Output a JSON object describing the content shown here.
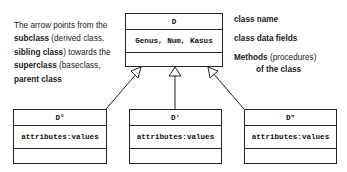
{
  "explanation": {
    "line1": "The arrow points from the",
    "subclass": "subclass",
    "line2_rest": " (derived class,",
    "sibling": "sibling class",
    "line3_rest": ") towards the",
    "superclass": "superclass",
    "line4_rest": " (baseclass,",
    "parent": "parent class"
  },
  "superclass_box": {
    "name": "D",
    "fields": "Genus, Num, Kasus",
    "methods": ""
  },
  "legend": {
    "class_name": "class name",
    "class_data_fields": "class data fields",
    "methods_bold": "Methods",
    "methods_rest": " (procedures)",
    "methods_line2": "of the class"
  },
  "subclasses": [
    {
      "name": "D°",
      "fields": "attributes:values",
      "methods": ""
    },
    {
      "name": "D'",
      "fields": "attributes:values",
      "methods": ""
    },
    {
      "name": "D\"",
      "fields": "attributes:values",
      "methods": ""
    }
  ]
}
